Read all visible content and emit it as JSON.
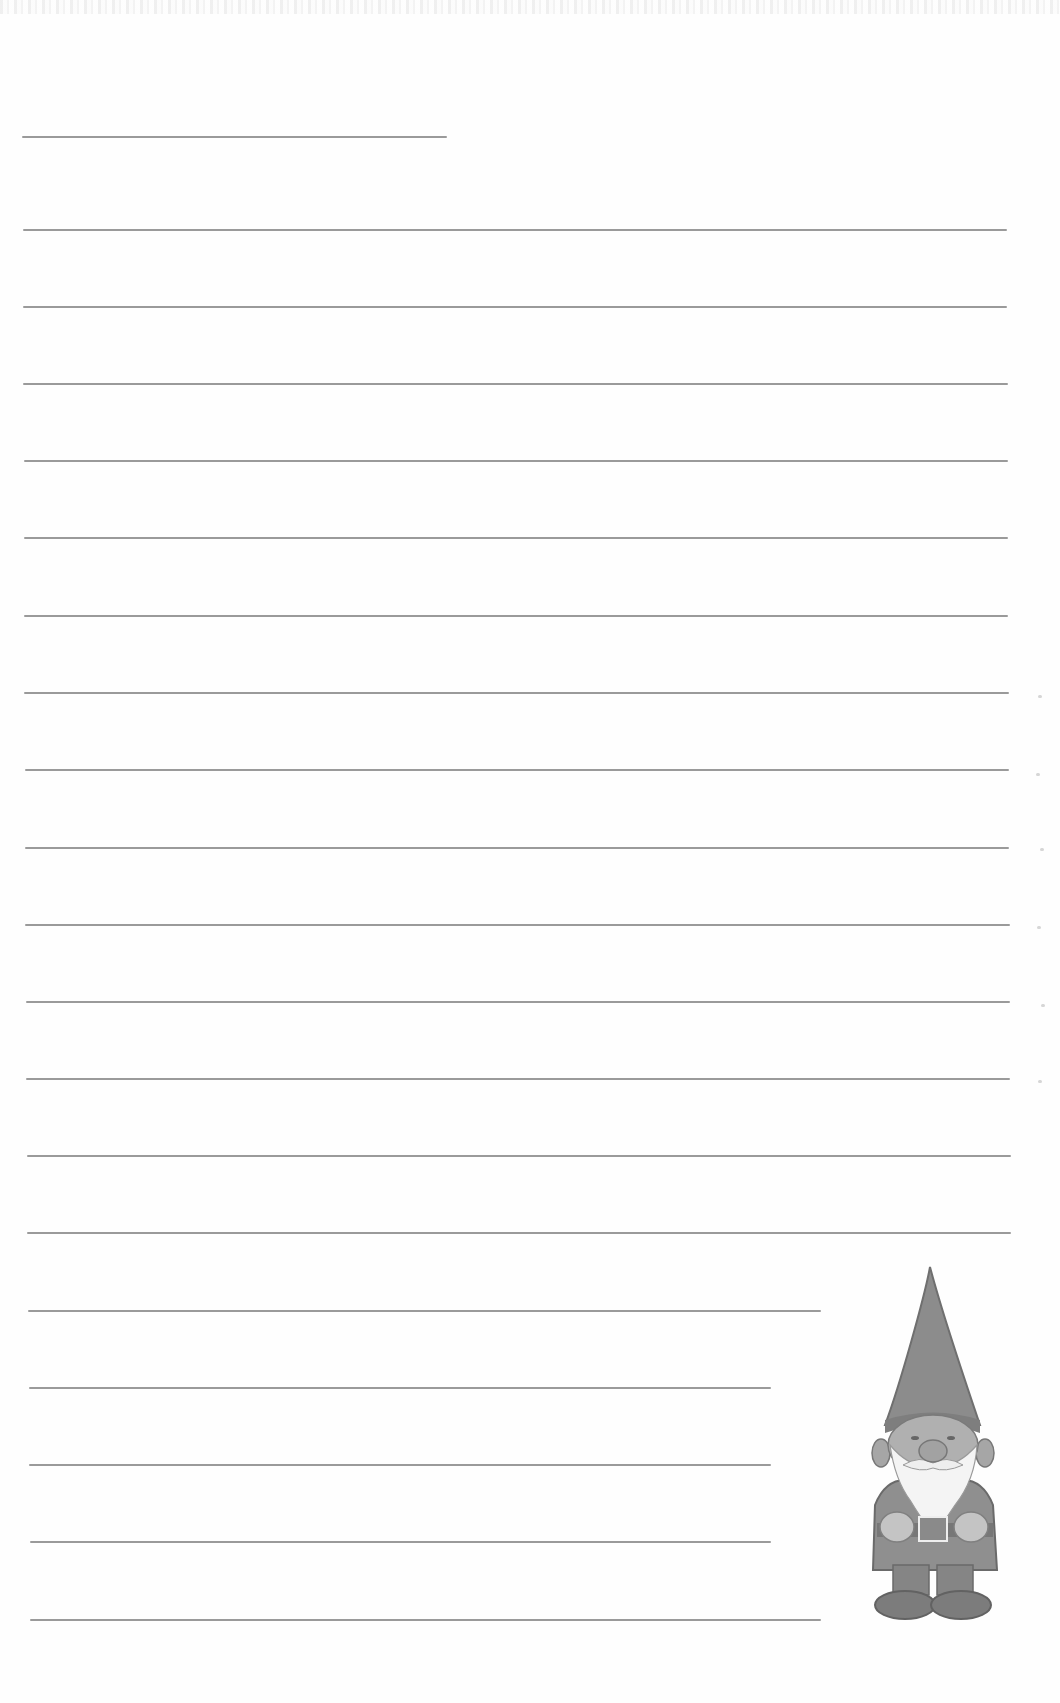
{
  "page": {
    "type": "lined-notepaper",
    "background": "#fefefe",
    "rule_color": "#9a9a9a",
    "short_title_line": {
      "x1": 22,
      "x2": 447,
      "y": 136
    },
    "rules": [
      {
        "x1": 23,
        "x2": 1007,
        "y": 229
      },
      {
        "x1": 23,
        "x2": 1007,
        "y": 306
      },
      {
        "x1": 23,
        "x2": 1008,
        "y": 383
      },
      {
        "x1": 24,
        "x2": 1008,
        "y": 460
      },
      {
        "x1": 24,
        "x2": 1008,
        "y": 537
      },
      {
        "x1": 24,
        "x2": 1008,
        "y": 615
      },
      {
        "x1": 24,
        "x2": 1009,
        "y": 692
      },
      {
        "x1": 25,
        "x2": 1009,
        "y": 769
      },
      {
        "x1": 25,
        "x2": 1009,
        "y": 847
      },
      {
        "x1": 25,
        "x2": 1010,
        "y": 924
      },
      {
        "x1": 26,
        "x2": 1010,
        "y": 1001
      },
      {
        "x1": 26,
        "x2": 1010,
        "y": 1078
      },
      {
        "x1": 27,
        "x2": 1011,
        "y": 1155
      },
      {
        "x1": 27,
        "x2": 1011,
        "y": 1232
      },
      {
        "x1": 28,
        "x2": 821,
        "y": 1310
      },
      {
        "x1": 29,
        "x2": 771,
        "y": 1387
      },
      {
        "x1": 29,
        "x2": 771,
        "y": 1464
      },
      {
        "x1": 30,
        "x2": 771,
        "y": 1541
      },
      {
        "x1": 30,
        "x2": 821,
        "y": 1619
      }
    ]
  },
  "illustration": {
    "name": "garden gnome",
    "icon": "gnome-illustration",
    "position": "bottom-right"
  }
}
